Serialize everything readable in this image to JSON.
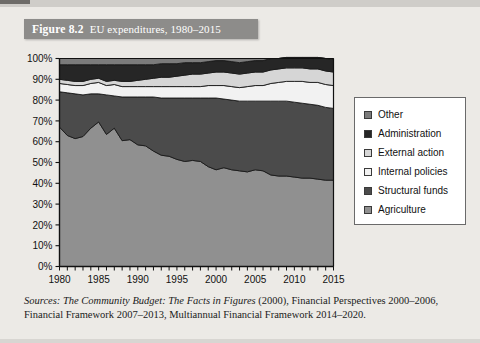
{
  "figure": {
    "number": "Figure 8.2",
    "title": "EU expenditures, 1980–2015"
  },
  "source": {
    "label": "Sources:",
    "line1_italic": "The Community Budget: The Facts in Figures",
    "line1_rest": "(2000), Financial Perspectives",
    "line2": "2000–2006, Financial Framework 2007–2013, Multiannual Financial Framework",
    "line3": "2014–2020."
  },
  "legend": {
    "items": [
      {
        "label": "Other",
        "color": "#7b7b7b"
      },
      {
        "label": "Administration",
        "color": "#262626"
      },
      {
        "label": "External action",
        "color": "#d6d6d6"
      },
      {
        "label": "Internal policies",
        "color": "#f2f2f2"
      },
      {
        "label": "Structural funds",
        "color": "#4b4b4b"
      },
      {
        "label": "Agriculture",
        "color": "#909090"
      }
    ]
  },
  "chart_data": {
    "type": "area",
    "stacked": true,
    "stack_order": [
      "Agriculture",
      "Structural funds",
      "Internal policies",
      "External action",
      "Administration",
      "Other"
    ],
    "title": "EU expenditures, 1980–2015",
    "xlabel": "",
    "ylabel": "",
    "xlim": [
      1980,
      2015
    ],
    "ylim": [
      0,
      100
    ],
    "ytick_labels": [
      "0%",
      "10%",
      "20%",
      "30%",
      "40%",
      "50%",
      "60%",
      "70%",
      "80%",
      "90%",
      "100%"
    ],
    "ytick_values": [
      0,
      10,
      20,
      30,
      40,
      50,
      60,
      70,
      80,
      90,
      100
    ],
    "xtick_labels": [
      "1980",
      "1985",
      "1990",
      "1995",
      "2000",
      "2005",
      "2010",
      "2015"
    ],
    "xtick_values": [
      1980,
      1985,
      1990,
      1995,
      2000,
      2005,
      2010,
      2015
    ],
    "minor_xticks_every": 1,
    "grid": false,
    "legend_position": "right",
    "x": [
      1980,
      1981,
      1982,
      1983,
      1984,
      1985,
      1986,
      1987,
      1988,
      1989,
      1990,
      1991,
      1992,
      1993,
      1994,
      1995,
      1996,
      1997,
      1998,
      1999,
      2000,
      2001,
      2002,
      2003,
      2004,
      2005,
      2006,
      2007,
      2008,
      2009,
      2010,
      2011,
      2012,
      2013,
      2014,
      2015
    ],
    "series": [
      {
        "name": "Agriculture",
        "color": "#909090",
        "values": [
          67.0,
          63.0,
          61.5,
          62.5,
          66.5,
          69.5,
          63.5,
          66.5,
          60.5,
          61.0,
          58.5,
          58.0,
          55.5,
          53.5,
          53.0,
          51.5,
          50.5,
          51.0,
          50.5,
          48.0,
          46.5,
          47.5,
          46.5,
          46.0,
          45.5,
          46.5,
          46.0,
          44.0,
          43.5,
          43.5,
          43.0,
          42.5,
          42.5,
          42.0,
          41.5,
          41.5
        ]
      },
      {
        "name": "Structural funds",
        "color": "#4b4b4b",
        "values": [
          17.0,
          20.5,
          21.5,
          20.0,
          16.5,
          13.5,
          19.0,
          15.5,
          21.0,
          20.5,
          23.0,
          23.5,
          26.0,
          27.5,
          28.0,
          29.5,
          30.5,
          30.0,
          30.5,
          33.0,
          34.5,
          33.0,
          33.5,
          33.5,
          34.0,
          33.0,
          33.5,
          35.5,
          36.0,
          36.0,
          36.0,
          36.0,
          35.5,
          35.5,
          35.0,
          34.5
        ]
      },
      {
        "name": "Internal policies",
        "color": "#f2f2f2",
        "values": [
          4.0,
          4.0,
          4.0,
          4.5,
          5.0,
          5.5,
          4.5,
          5.5,
          5.0,
          5.0,
          5.0,
          5.0,
          5.0,
          5.5,
          5.5,
          5.5,
          5.5,
          5.5,
          5.5,
          6.0,
          6.0,
          6.5,
          6.5,
          6.5,
          7.0,
          7.5,
          7.5,
          8.5,
          9.0,
          9.5,
          10.0,
          10.5,
          10.5,
          11.0,
          11.0,
          11.0
        ]
      },
      {
        "name": "External action",
        "color": "#d6d6d6",
        "values": [
          2.0,
          2.0,
          2.0,
          2.0,
          2.0,
          2.0,
          2.0,
          2.0,
          2.5,
          2.5,
          3.0,
          3.5,
          4.0,
          4.5,
          4.5,
          5.0,
          5.5,
          6.0,
          6.0,
          6.0,
          6.5,
          6.5,
          6.5,
          6.5,
          6.5,
          6.5,
          6.5,
          6.5,
          6.5,
          6.5,
          6.5,
          6.5,
          6.5,
          6.5,
          6.5,
          6.5
        ]
      },
      {
        "name": "Administration",
        "color": "#262626",
        "values": [
          7.0,
          7.5,
          8.0,
          8.0,
          7.0,
          6.5,
          8.0,
          7.5,
          8.0,
          8.0,
          7.5,
          7.0,
          6.5,
          6.5,
          6.5,
          6.0,
          6.0,
          5.5,
          5.5,
          5.5,
          5.5,
          5.5,
          5.5,
          5.5,
          5.5,
          5.5,
          5.5,
          5.5,
          5.0,
          5.0,
          5.0,
          5.0,
          5.5,
          5.5,
          6.0,
          6.0
        ]
      },
      {
        "name": "Other",
        "color": "#7b7b7b",
        "values": [
          3.0,
          3.0,
          3.0,
          3.0,
          3.0,
          3.0,
          3.0,
          3.0,
          3.0,
          3.0,
          3.0,
          3.0,
          3.0,
          2.5,
          2.5,
          2.5,
          2.0,
          2.0,
          2.0,
          1.5,
          1.0,
          1.0,
          1.5,
          2.0,
          1.5,
          1.0,
          1.0,
          0.0,
          0.0,
          0.0,
          0.0,
          0.0,
          0.0,
          0.0,
          0.0,
          0.5
        ]
      }
    ]
  }
}
